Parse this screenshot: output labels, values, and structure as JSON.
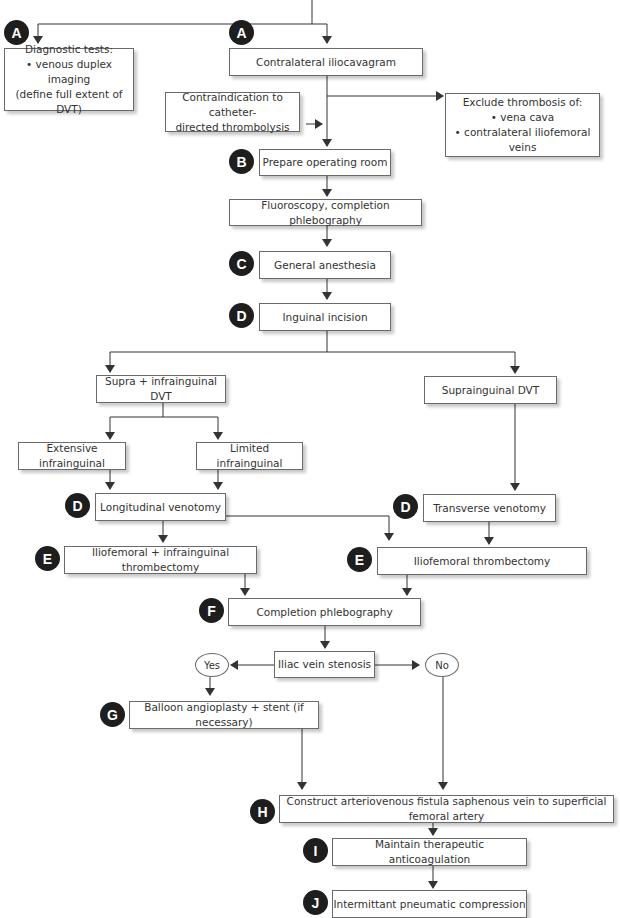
{
  "nodes": {
    "diagnostic_tests": {
      "badge": "A",
      "lines": [
        "Diagnostic tests:",
        "• venous duplex imaging",
        "(define full extent of DVT)"
      ]
    },
    "contralateral_iliocavagram": {
      "badge": "A",
      "label": "Contralateral iliocavagram"
    },
    "contraindication": {
      "lines": [
        "Contraindication to catheter-",
        "directed thrombolysis"
      ]
    },
    "exclude_thrombosis": {
      "lines": [
        "Exclude thrombosis of:",
        "• vena cava",
        "• contralateral iliofemoral veins"
      ]
    },
    "prepare_or": {
      "badge": "B",
      "label": "Prepare operating room"
    },
    "fluoroscopy": {
      "label": "Fluoroscopy, completion phlebography"
    },
    "general_anesthesia": {
      "badge": "C",
      "label": "General anesthesia"
    },
    "inguinal_incision": {
      "badge": "D",
      "label": "Inguinal incision"
    },
    "supra_infra_dvt": {
      "label": "Supra + infrainguinal DVT"
    },
    "suprainguinal_dvt": {
      "label": "Suprainguinal DVT"
    },
    "extensive_infra": {
      "label": "Extensive infrainguinal"
    },
    "limited_infra": {
      "label": "Limited infrainguinal"
    },
    "longitudinal_venotomy": {
      "badge": "D",
      "label": "Longitudinal venotomy"
    },
    "transverse_venotomy": {
      "badge": "D",
      "label": "Transverse venotomy"
    },
    "iliofemoral_infra_thrombectomy": {
      "badge": "E",
      "label": "Iliofemoral + infrainguinal thrombectomy"
    },
    "iliofemoral_thrombectomy": {
      "badge": "E",
      "label": "Iliofemoral thrombectomy"
    },
    "completion_phlebography": {
      "badge": "F",
      "label": "Completion phlebography"
    },
    "iliac_vein_stenosis": {
      "label": "Iliac vein stenosis"
    },
    "yes": {
      "label": "Yes"
    },
    "no": {
      "label": "No"
    },
    "balloon_angioplasty": {
      "badge": "G",
      "label": "Balloon angioplasty + stent (if necessary)"
    },
    "av_fistula": {
      "badge": "H",
      "label": "Construct arteriovenous fistula saphenous vein to superficial femoral artery"
    },
    "anticoagulation": {
      "badge": "I",
      "label": "Maintain therapeutic anticoagulation"
    },
    "pneumatic_compression": {
      "badge": "J",
      "label": "Intermittant pneumatic compression"
    }
  },
  "colors": {
    "line": "#333333",
    "badge": "#1e1e1e",
    "box_border": "#6a6a6a"
  }
}
